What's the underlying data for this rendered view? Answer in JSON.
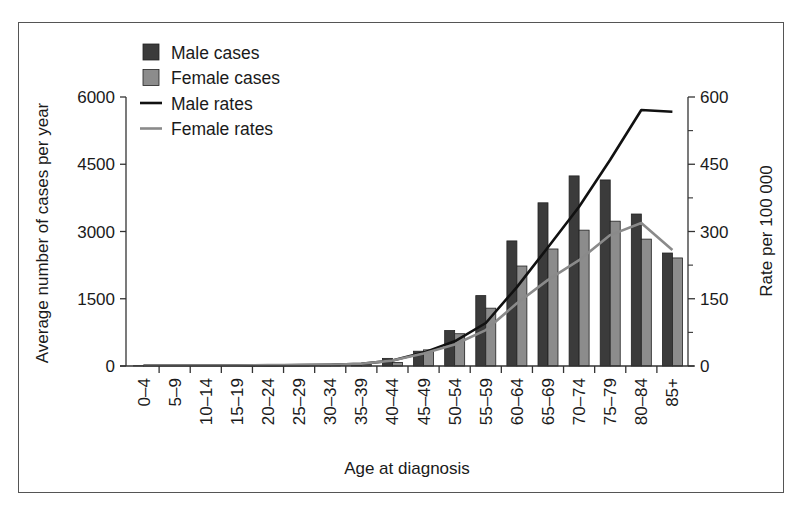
{
  "chart_data": {
    "type": "bar",
    "title": "",
    "xlabel": "Age at diagnosis",
    "ylabel": "Average number of cases per year",
    "y2label": "Rate per 100 000",
    "ylim": [
      0,
      6000
    ],
    "y2lim": [
      0,
      600
    ],
    "yticks": [
      0,
      1500,
      3000,
      4500,
      6000
    ],
    "y2ticks": [
      0,
      150,
      300,
      450,
      600
    ],
    "y2minor_ticks": [
      75,
      225,
      375,
      525
    ],
    "grid": false,
    "legend_position": "upper left",
    "categories": [
      "0–4",
      "5–9",
      "10–14",
      "15–19",
      "20–24",
      "25–29",
      "30–34",
      "35–39",
      "40–44",
      "45–49",
      "50–54",
      "55–59",
      "60–64",
      "65–69",
      "70–74",
      "75–79",
      "80–84",
      "85+"
    ],
    "series": [
      {
        "name": "Male cases",
        "kind": "bar",
        "axis": "left",
        "color": "#3b3b3b",
        "values": [
          5,
          3,
          3,
          5,
          8,
          10,
          15,
          30,
          170,
          330,
          790,
          1570,
          2790,
          3640,
          4240,
          4150,
          3390,
          2520
        ]
      },
      {
        "name": "Female cases",
        "kind": "bar",
        "axis": "left",
        "color": "#8c8c8c",
        "values": [
          5,
          3,
          3,
          5,
          8,
          12,
          18,
          35,
          80,
          360,
          720,
          1290,
          2230,
          2610,
          3030,
          3230,
          2830,
          2410
        ]
      },
      {
        "name": "Male rates",
        "kind": "line",
        "axis": "right",
        "color": "#111111",
        "values": [
          1,
          1,
          1,
          1,
          1,
          2,
          3,
          5,
          12,
          30,
          55,
          96,
          176,
          265,
          355,
          460,
          571,
          567
        ]
      },
      {
        "name": "Female rates",
        "kind": "line",
        "axis": "right",
        "color": "#8a8a8a",
        "values": [
          1,
          1,
          1,
          1,
          2,
          2,
          3,
          5,
          12,
          28,
          48,
          80,
          140,
          192,
          236,
          292,
          319,
          259
        ]
      }
    ]
  },
  "legend": {
    "items": [
      {
        "label": "Male cases",
        "type": "box",
        "color": "#3b3b3b"
      },
      {
        "label": "Female cases",
        "type": "box",
        "color": "#8c8c8c"
      },
      {
        "label": "Male rates",
        "type": "line",
        "color": "#111111"
      },
      {
        "label": "Female rates",
        "type": "line",
        "color": "#8a8a8a"
      }
    ]
  }
}
